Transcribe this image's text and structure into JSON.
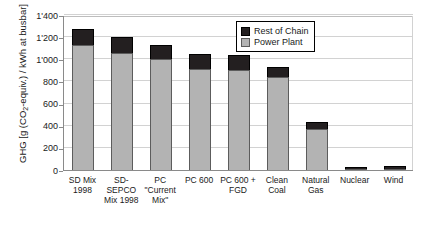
{
  "chart_data": {
    "type": "bar",
    "stacked": true,
    "title": "",
    "xlabel": "",
    "ylabel": "GHG [g (CO2-equiv.) / kWh at busbar]",
    "ylabel_prefix": "GHG [g (CO",
    "ylabel_sub": "2",
    "ylabel_suffix": "-equiv.) / kWh at busbar]",
    "ylim": [
      0,
      1400
    ],
    "ytick_values": [
      0,
      200,
      400,
      600,
      800,
      1000,
      1200,
      1400
    ],
    "ytick_labels": [
      "0",
      "200",
      "400",
      "600",
      "800",
      "1'000",
      "1'200",
      "1'400"
    ],
    "grid": true,
    "legend_position": "top-right",
    "categories": [
      "SD Mix 1998",
      "SD-SEPCO Mix 1998",
      "PC \"Current Mix\"",
      "PC 600",
      "PC 600 + FGD",
      "Clean Coal",
      "Natural Gas",
      "Nuclear",
      "Wind"
    ],
    "category_lines": [
      [
        "SD Mix",
        "1998"
      ],
      [
        "SD-",
        "SEPCO",
        "Mix 1998"
      ],
      [
        "PC",
        "\"Current",
        "Mix\""
      ],
      [
        "PC 600"
      ],
      [
        "PC 600 +",
        "FGD"
      ],
      [
        "Clean",
        "Coal"
      ],
      [
        "Natural",
        "Gas"
      ],
      [
        "Nuclear"
      ],
      [
        "Wind"
      ]
    ],
    "series": [
      {
        "name": "Power Plant",
        "color": "#b3b3b3",
        "values": [
          1130,
          1055,
          1000,
          910,
          900,
          840,
          370,
          8,
          5
        ]
      },
      {
        "name": "Rest of Chain",
        "color": "#231f20",
        "values": [
          145,
          145,
          125,
          135,
          140,
          90,
          60,
          17,
          25
        ]
      }
    ],
    "totals": [
      1275,
      1200,
      1125,
      1045,
      1040,
      930,
      430,
      25,
      30
    ]
  },
  "legend": {
    "items": [
      {
        "label": "Rest of Chain",
        "color": "#231f20"
      },
      {
        "label": "Power Plant",
        "color": "#b3b3b3"
      }
    ]
  }
}
